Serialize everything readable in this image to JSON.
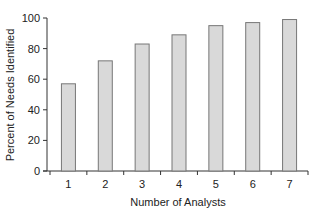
{
  "chart_data": {
    "type": "bar",
    "title": "",
    "xlabel": "Number of Analysts",
    "ylabel": "Percent of Needs Identified",
    "categories": [
      "1",
      "2",
      "3",
      "4",
      "5",
      "6",
      "7"
    ],
    "values": [
      57,
      72,
      83,
      89,
      95,
      97,
      99
    ],
    "ylim": [
      0,
      100
    ],
    "yticks": [
      0,
      20,
      40,
      60,
      80,
      100
    ],
    "grid": false,
    "legend": null,
    "bar_fill": "#d9d9d9",
    "bar_stroke": "#777777"
  }
}
